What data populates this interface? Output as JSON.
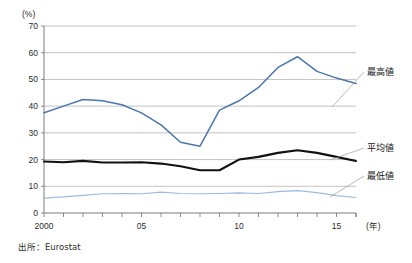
{
  "chart_data": {
    "type": "line",
    "title": "",
    "subtitle": "",
    "xlabel": "(年)",
    "ylabel": "(%)",
    "ylim": [
      0,
      70
    ],
    "xlim": [
      2000,
      2016
    ],
    "ytick_step": 10,
    "grid": "horizontal",
    "legend_position": "right-inline-labels",
    "x": [
      2000,
      2001,
      2002,
      2003,
      2004,
      2005,
      2006,
      2007,
      2008,
      2009,
      2010,
      2011,
      2012,
      2013,
      2014,
      2015,
      2016
    ],
    "ytick_labels": [
      "0",
      "10",
      "20",
      "30",
      "40",
      "50",
      "60",
      "70"
    ],
    "ytick_values": [
      0,
      10,
      20,
      30,
      40,
      50,
      60,
      70
    ],
    "xtick_labels": [
      "2000",
      "05",
      "10",
      "15"
    ],
    "xtick_values": [
      2000,
      2005,
      2010,
      2015
    ],
    "series": [
      {
        "name": "最高値",
        "color": "#4a76ad",
        "values": [
          37.5,
          40.0,
          42.5,
          42.0,
          40.5,
          37.5,
          33.0,
          26.5,
          25.0,
          38.5,
          42.0,
          47.0,
          54.5,
          58.5,
          53.0,
          50.5,
          48.5
        ]
      },
      {
        "name": "平均値",
        "color": "#111111",
        "values": [
          19.3,
          19.0,
          19.5,
          18.9,
          18.9,
          19.0,
          18.5,
          17.5,
          16.0,
          16.0,
          20.0,
          21.0,
          22.5,
          23.5,
          22.5,
          21.0,
          19.5
        ]
      },
      {
        "name": "最低値",
        "color": "#9dbbdb",
        "values": [
          5.6,
          6.0,
          6.6,
          7.2,
          7.3,
          7.2,
          7.8,
          7.3,
          7.2,
          7.3,
          7.5,
          7.3,
          8.0,
          8.4,
          7.6,
          6.5,
          5.8
        ]
      }
    ],
    "annotations": [
      {
        "text": "最高値",
        "series": "max"
      },
      {
        "text": "平均値",
        "series": "average"
      },
      {
        "text": "最低値",
        "series": "min"
      }
    ],
    "source_note": "出所：Eurostat"
  }
}
